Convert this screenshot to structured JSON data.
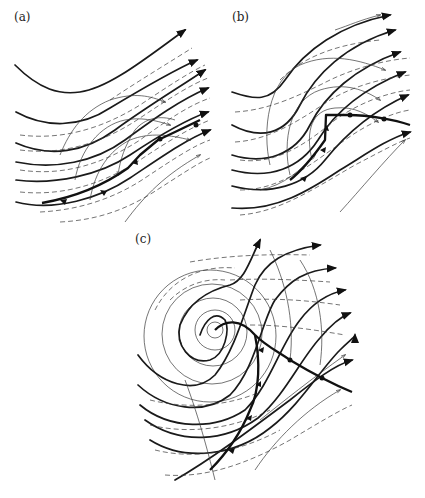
{
  "figure": {
    "panels": [
      {
        "id": "a",
        "label": "(a)",
        "stage": "initial frontal wave"
      },
      {
        "id": "b",
        "label": "(b)",
        "stage": "developing wave with kinked front"
      },
      {
        "id": "c",
        "label": "(c)",
        "stage": "mature cyclone with closed circulation and occlusion"
      }
    ],
    "legend_implied": {
      "thick_solid": "height/pressure contours with arrows",
      "thin_solid": "streamlines/trajectories",
      "dashed": "isotherms",
      "heavy_line_with_triangles": "cold front",
      "heavy_line_with_semicircles": "warm front"
    },
    "colors": {
      "ink": "#1a1a1a",
      "background": "#ffffff"
    }
  }
}
